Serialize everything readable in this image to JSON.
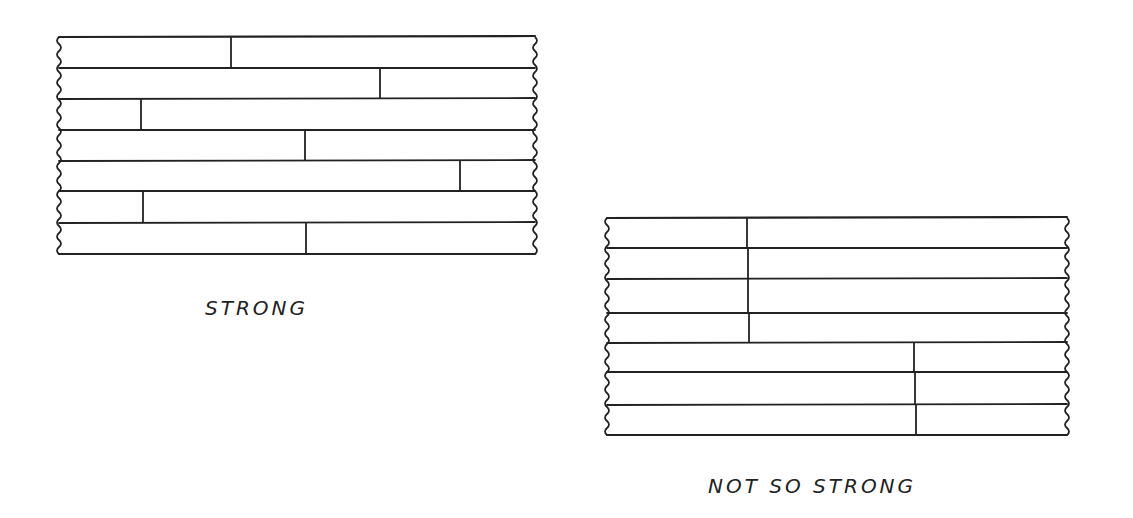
{
  "colors": {
    "ink": "#222222",
    "background": "#ffffff"
  },
  "diagrams": [
    {
      "id": "strong",
      "caption": "STRONG",
      "caption_pos": {
        "x": 205,
        "y": 296
      },
      "left": 59,
      "right": 535,
      "row_y": [
        37,
        68,
        99,
        130,
        161,
        191,
        223,
        254
      ],
      "joints": [
        {
          "row": 0,
          "x": 231
        },
        {
          "row": 1,
          "x": 380
        },
        {
          "row": 2,
          "x": 141
        },
        {
          "row": 3,
          "x": 305
        },
        {
          "row": 4,
          "x": 460
        },
        {
          "row": 5,
          "x": 143
        },
        {
          "row": 6,
          "x": 306
        }
      ]
    },
    {
      "id": "not-so-strong",
      "caption": "NOT SO STRONG",
      "caption_pos": {
        "x": 708,
        "y": 474
      },
      "left": 607,
      "right": 1067,
      "row_y": [
        218,
        248,
        279,
        313,
        343,
        372,
        405,
        435
      ],
      "joints": [
        {
          "row": 0,
          "x": 747
        },
        {
          "row": 1,
          "x": 748
        },
        {
          "row": 2,
          "x": 748
        },
        {
          "row": 3,
          "x": 749
        },
        {
          "row": 4,
          "x": 914
        },
        {
          "row": 5,
          "x": 915
        },
        {
          "row": 6,
          "x": 916
        }
      ]
    }
  ]
}
